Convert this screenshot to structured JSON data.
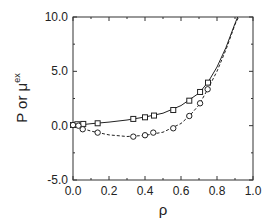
{
  "chart_data": {
    "type": "line",
    "title": "",
    "xlabel": "ρ",
    "ylabel": "P or μ",
    "ylabel_superscript": "ex",
    "xlim": [
      0.0,
      1.0
    ],
    "ylim": [
      -5.0,
      10.0
    ],
    "xticks": [
      "0.0",
      "0.2",
      "0.4",
      "0.6",
      "0.8",
      "1.0"
    ],
    "yticks": [
      "-5.0",
      "0.0",
      "5.0",
      "10.0"
    ],
    "grid": false,
    "legend": "none",
    "series": [
      {
        "name": "P",
        "marker": "square",
        "line": "solid",
        "points": [
          [
            0.0,
            0.06
          ],
          [
            0.024,
            0.13
          ],
          [
            0.057,
            0.16
          ],
          [
            0.137,
            0.22
          ],
          [
            0.335,
            0.62
          ],
          [
            0.4,
            0.77
          ],
          [
            0.45,
            0.93
          ],
          [
            0.557,
            1.44
          ],
          [
            0.646,
            2.3
          ],
          [
            0.706,
            3.1
          ],
          [
            0.75,
            3.96
          ]
        ],
        "curve": [
          [
            0.0,
            0.0
          ],
          [
            0.1,
            0.18
          ],
          [
            0.2,
            0.33
          ],
          [
            0.3,
            0.52
          ],
          [
            0.4,
            0.8
          ],
          [
            0.5,
            1.15
          ],
          [
            0.6,
            1.85
          ],
          [
            0.7,
            3.0
          ],
          [
            0.75,
            4.0
          ],
          [
            0.8,
            5.4
          ],
          [
            0.85,
            7.2
          ],
          [
            0.9,
            9.4
          ],
          [
            0.915,
            10.0
          ]
        ]
      },
      {
        "name": "μ^ex",
        "marker": "circle",
        "line": "dashed",
        "points": [
          [
            0.0,
            0.06
          ],
          [
            0.03,
            0.0
          ],
          [
            0.054,
            -0.33
          ],
          [
            0.137,
            -0.64
          ],
          [
            0.335,
            -1.01
          ],
          [
            0.4,
            -0.88
          ],
          [
            0.446,
            -0.64
          ],
          [
            0.557,
            -0.24
          ],
          [
            0.646,
            0.89
          ],
          [
            0.706,
            2.06
          ],
          [
            0.748,
            3.35
          ]
        ],
        "curve": [
          [
            0.0,
            0.0
          ],
          [
            0.1,
            -0.5
          ],
          [
            0.2,
            -0.85
          ],
          [
            0.3,
            -1.0
          ],
          [
            0.4,
            -0.9
          ],
          [
            0.5,
            -0.6
          ],
          [
            0.6,
            0.2
          ],
          [
            0.65,
            0.95
          ],
          [
            0.7,
            1.9
          ],
          [
            0.75,
            3.4
          ],
          [
            0.8,
            5.0
          ],
          [
            0.85,
            7.0
          ],
          [
            0.9,
            9.3
          ],
          [
            0.92,
            10.0
          ]
        ]
      }
    ]
  },
  "plot": {
    "left": 73,
    "top": 17,
    "right": 253,
    "bottom": 180
  }
}
